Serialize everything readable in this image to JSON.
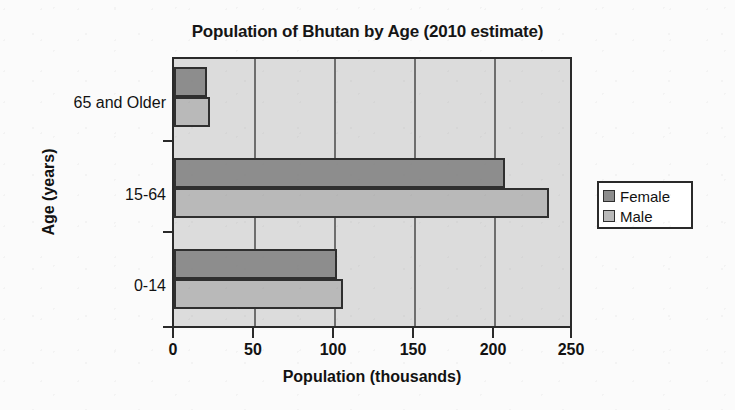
{
  "chart_data": {
    "type": "bar",
    "orientation": "horizontal",
    "title": "Population of Bhutan by Age (2010 estimate)",
    "xlabel": "Population (thousands)",
    "ylabel": "Age (years)",
    "categories": [
      "0-14",
      "15-64",
      "65 and Older"
    ],
    "series": [
      {
        "name": "Female",
        "color": "#8d8d8d",
        "values": [
          103,
          209,
          21
        ]
      },
      {
        "name": "Male",
        "color": "#b9b9b9",
        "values": [
          107,
          237,
          23
        ]
      }
    ],
    "xlim": [
      0,
      250
    ],
    "xticks": [
      0,
      50,
      100,
      150,
      200,
      250
    ],
    "xtick_labels": [
      "0",
      "50",
      "100",
      "150",
      "200",
      "250"
    ],
    "grid": "vertical",
    "legend_position": "right",
    "legend_entries": [
      "Female",
      "Male"
    ],
    "plot_background": "#dcdcdc",
    "axis_color": "#2a2a2a"
  },
  "legend": {
    "items": [
      {
        "label": "Female",
        "swatch": "female"
      },
      {
        "label": "Male",
        "swatch": "male"
      }
    ]
  }
}
